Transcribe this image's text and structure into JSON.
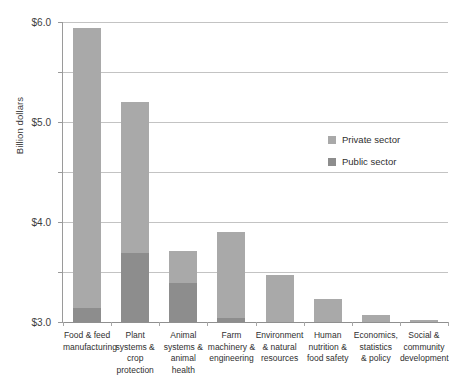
{
  "chart_data": {
    "type": "bar",
    "stacked": true,
    "title": "",
    "xlabel": "",
    "ylabel": "Billion dollars",
    "ylim": [
      0.0,
      6.0
    ],
    "ytick_labels": [
      "$0.0",
      "$1.0",
      "$2.0",
      "$3.0",
      "$4.0",
      "$5.0",
      "$6.0"
    ],
    "ytick_values": [
      0.0,
      1.0,
      2.0,
      3.0,
      4.0,
      5.0,
      6.0
    ],
    "grid": true,
    "legend_position": "inside-right",
    "categories": [
      "Food & feed manufacturing",
      "Plant systems & crop protection",
      "Animal systems & animal health",
      "Farm machinery & engineering",
      "Environment & natural resources",
      "Human nutrition & food safety",
      "Economics, statistics & policy",
      "Social & community development"
    ],
    "category_lines": [
      [
        "Food & feed",
        "manufacturing"
      ],
      [
        "Plant",
        "systems &",
        "crop",
        "protection"
      ],
      [
        "Animal",
        "systems &",
        "animal",
        "health"
      ],
      [
        "Farm",
        "machinery &",
        "engineering"
      ],
      [
        "Environment",
        "& natural",
        "resources"
      ],
      [
        "Human",
        "nutrition &",
        "food safety"
      ],
      [
        "Economics,",
        "statistics",
        "& policy"
      ],
      [
        "Social &",
        "community",
        "development"
      ]
    ],
    "series": [
      {
        "name": "Public sector",
        "color": "#8d8d8d",
        "values": [
          0.28,
          1.38,
          0.78,
          0.08,
          0.0,
          0.0,
          0.0,
          0.0
        ]
      },
      {
        "name": "Private sector",
        "color": "#a9a9a9",
        "values": [
          5.6,
          3.02,
          0.64,
          1.72,
          0.95,
          0.46,
          0.15,
          0.05
        ]
      }
    ],
    "totals": [
      5.88,
      4.4,
      1.42,
      1.8,
      0.95,
      0.46,
      0.15,
      0.05
    ]
  },
  "legend": {
    "items": [
      {
        "label": "Private sector",
        "color": "#a9a9a9"
      },
      {
        "label": "Public sector",
        "color": "#8d8d8d"
      }
    ]
  }
}
